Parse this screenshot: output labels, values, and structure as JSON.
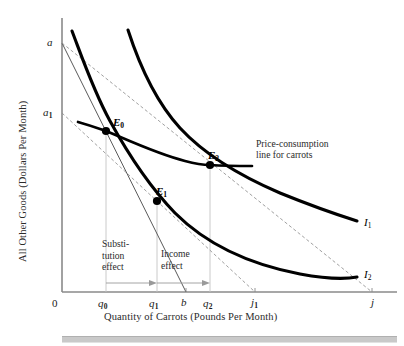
{
  "figure": {
    "domain": "economics-indifference-curve-diagram",
    "axes": {
      "y_title": "All Other Goods (Dollars Per Month)",
      "x_title": "Quantity of Carrots (Pounds Per Month)",
      "origin_label": "0",
      "y_ticks": [
        {
          "label": "a",
          "sub": "",
          "x": 47,
          "y": 36
        },
        {
          "label": "a",
          "sub": "1",
          "x": 43,
          "y": 107
        }
      ],
      "x_ticks": [
        {
          "label": "0",
          "sub": "",
          "x": 52,
          "y": 299
        },
        {
          "label": "q",
          "sub": "0",
          "x": 99,
          "y": 299
        },
        {
          "label": "q",
          "sub": "1",
          "x": 150,
          "y": 299
        },
        {
          "label": "b",
          "sub": "",
          "x": 182,
          "y": 299
        },
        {
          "label": "q",
          "sub": "2",
          "x": 204,
          "y": 299
        },
        {
          "label": "j",
          "sub": "1",
          "x": 251,
          "y": 299
        },
        {
          "label": "j",
          "sub": "",
          "x": 371,
          "y": 299
        }
      ]
    },
    "points": [
      {
        "name": "E0",
        "label": "E",
        "sub": "0",
        "x": 106,
        "y": 131,
        "label_x": 113,
        "label_y": 118
      },
      {
        "name": "E1",
        "label": "E",
        "sub": "1",
        "x": 157,
        "y": 201,
        "label_x": 157,
        "label_y": 187
      },
      {
        "name": "E2",
        "label": "E",
        "sub": "2",
        "x": 210,
        "y": 165,
        "label_x": 209,
        "label_y": 151
      }
    ],
    "curves": [
      {
        "name": "I1",
        "label": "I",
        "sub": "1",
        "label_x": 364,
        "label_y": 219
      },
      {
        "name": "I2",
        "label": "I",
        "sub": "2",
        "label_x": 364,
        "label_y": 271
      }
    ],
    "annotations": {
      "price_consumption": {
        "line1": "Price-consumption",
        "line2": "line for carrots",
        "x": 256,
        "y": 146
      },
      "substitution_effect": {
        "line1": "Substi-",
        "line2": "tution",
        "line3": "effect",
        "x": 102,
        "y": 243
      },
      "income_effect": {
        "line1": "Income",
        "line2": "effect",
        "x": 161,
        "y": 250
      }
    },
    "colors": {
      "curve": "#000000",
      "budget_line": "#6e6e6e",
      "axis": "#8a8a8a",
      "guide": "#bdbdbd",
      "text": "#1a1a1a",
      "bottom_bar": "#c9c9c9"
    }
  }
}
